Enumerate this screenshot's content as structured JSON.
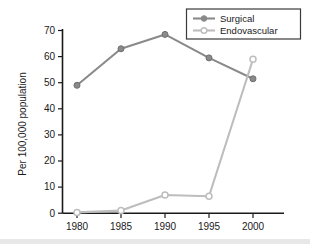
{
  "chart_data": {
    "type": "line",
    "title": "",
    "xlabel": "",
    "ylabel": "Per 100,000 population",
    "categories": [
      "1980",
      "1985",
      "1990",
      "1995",
      "2000"
    ],
    "x": [
      1980,
      1985,
      1990,
      1995,
      2000
    ],
    "xlim": [
      1977.5,
      2002.5
    ],
    "ylim": [
      0,
      72
    ],
    "yticks": [
      0,
      10,
      20,
      30,
      40,
      50,
      60,
      70
    ],
    "ytick_labels": [
      "0",
      "10",
      "20",
      "30",
      "40",
      "50",
      "60",
      "70"
    ],
    "grid": false,
    "legend_position": "top-right",
    "series": [
      {
        "name": "Surgical",
        "color": "#8a8a8a",
        "marker": "filled-circle",
        "values": [
          49,
          63,
          68.5,
          59.5,
          51.5
        ]
      },
      {
        "name": "Endovascular",
        "color": "#bdbdbd",
        "marker": "open-circle",
        "values": [
          0.3,
          1,
          7,
          6.5,
          59
        ]
      }
    ]
  },
  "legend": {
    "entries": [
      {
        "label": "Surgical",
        "color": "#8a8a8a",
        "marker": "filled-circle"
      },
      {
        "label": "Endovascular",
        "color": "#bdbdbd",
        "marker": "open-circle"
      }
    ]
  },
  "axes": {
    "y_title": "Per 100,000 population",
    "y_ticks": [
      "70",
      "60",
      "50",
      "40",
      "30",
      "20",
      "10",
      "0"
    ],
    "x_ticks": [
      "1980",
      "1985",
      "1990",
      "1995",
      "2000"
    ]
  },
  "colors": {
    "surgical": "#8a8a8a",
    "endovascular": "#bdbdbd",
    "axis": "#1a1a1a",
    "background": "#ffffff",
    "bottom_band": "#e8e8e8"
  }
}
